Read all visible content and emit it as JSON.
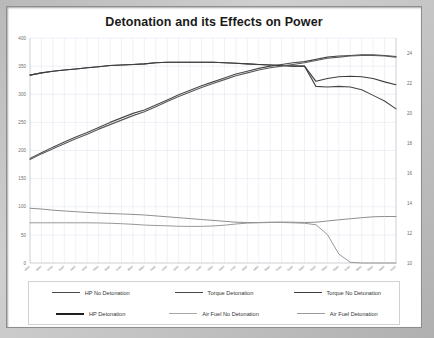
{
  "chart_data": {
    "type": "line",
    "title": "Detonation and its Effects on Power",
    "xlabel": "",
    "ylabel": "",
    "grid": true,
    "legend_position": "bottom",
    "x": [
      2900,
      3000,
      3100,
      3200,
      3300,
      3400,
      3500,
      3600,
      3700,
      3800,
      3900,
      4000,
      4100,
      4200,
      4300,
      4400,
      4500,
      4600,
      4700,
      4800,
      4900,
      5000,
      5100,
      5200,
      5300,
      5400,
      5500,
      5600,
      5700,
      5800,
      5900,
      6000,
      6100
    ],
    "xtick_labels": [
      "2900",
      "3000",
      "3100",
      "3200",
      "3300",
      "3400",
      "3500",
      "3600",
      "3700",
      "3800",
      "3900",
      "4000",
      "4100",
      "4200",
      "4300",
      "4400",
      "4500",
      "4600",
      "4700",
      "4800",
      "4900",
      "5000",
      "5100",
      "5200",
      "5300",
      "5400",
      "5500",
      "5600",
      "5700",
      "5800",
      "5900",
      "6000",
      "6100"
    ],
    "y_left": {
      "label": "",
      "min": 0,
      "max": 400,
      "ticks": [
        0,
        50,
        100,
        150,
        200,
        250,
        300,
        350,
        400
      ]
    },
    "y_right": {
      "label": "",
      "min": 10,
      "max": 25,
      "ticks": [
        10,
        12,
        14,
        16,
        18,
        20,
        22,
        24
      ]
    },
    "series": [
      {
        "name": "HP No Detonation",
        "axis": "left",
        "color": "#4a4a4a",
        "width": 1.1,
        "values": [
          186,
          196,
          206,
          215,
          224,
          232,
          241,
          250,
          258,
          266,
          272,
          281,
          290,
          299,
          307,
          315,
          322,
          329,
          336,
          341,
          346,
          350,
          353,
          356,
          358,
          362,
          366,
          368,
          369,
          370,
          370,
          369,
          367
        ]
      },
      {
        "name": "Torque Detonation",
        "axis": "left",
        "color": "#474747",
        "width": 1.1,
        "values": [
          334,
          338,
          341,
          343,
          345,
          347,
          349,
          351,
          352,
          353,
          354,
          356,
          357,
          357,
          357,
          357,
          357,
          356,
          355,
          354,
          353,
          352,
          351,
          350,
          350,
          314,
          313,
          314,
          313,
          308,
          298,
          288,
          274
        ]
      },
      {
        "name": "Torque No Detonation",
        "axis": "left",
        "color": "#3d3d3d",
        "width": 1.1,
        "values": [
          334,
          338,
          341,
          343,
          345,
          347,
          349,
          351,
          352,
          353,
          354,
          356,
          357,
          357,
          357,
          357,
          357,
          356,
          355,
          354,
          353,
          352,
          351,
          350,
          350,
          323,
          328,
          331,
          332,
          331,
          328,
          322,
          317
        ]
      },
      {
        "name": "HP Detonation",
        "axis": "left",
        "color": "#5a5a5a",
        "width": 1.1,
        "values": [
          184,
          194,
          203,
          212,
          221,
          229,
          238,
          246,
          254,
          262,
          269,
          278,
          287,
          296,
          304,
          312,
          319,
          326,
          333,
          338,
          343,
          347,
          350,
          353,
          356,
          360,
          364,
          366,
          368,
          369,
          369,
          368,
          366
        ]
      },
      {
        "name": "Air Fuel No Detonation",
        "axis": "right",
        "color": "#8f8f8f",
        "width": 1.0,
        "values": [
          13.65,
          13.6,
          13.52,
          13.47,
          13.42,
          13.37,
          13.33,
          13.3,
          13.27,
          13.24,
          13.2,
          13.14,
          13.08,
          13.02,
          12.96,
          12.9,
          12.84,
          12.78,
          12.72,
          12.7,
          12.7,
          12.72,
          12.73,
          12.72,
          12.7,
          12.72,
          12.8,
          12.88,
          12.95,
          13.02,
          13.08,
          13.1,
          13.1
        ]
      },
      {
        "name": "Air Fuel Detonation",
        "axis": "right",
        "color": "#989898",
        "width": 1.0,
        "values": [
          12.68,
          12.68,
          12.68,
          12.68,
          12.68,
          12.68,
          12.67,
          12.65,
          12.62,
          12.58,
          12.53,
          12.5,
          12.48,
          12.45,
          12.44,
          12.44,
          12.47,
          12.52,
          12.6,
          12.66,
          12.68,
          12.7,
          12.7,
          12.68,
          12.65,
          12.55,
          11.9,
          10.6,
          10.05,
          10.0,
          10.0,
          10.0,
          10.0
        ]
      }
    ],
    "annotations": []
  },
  "legend": {
    "rows": [
      [
        {
          "label": "HP No Detonation",
          "color": "#4a4a4a",
          "width": "1.8px"
        },
        {
          "label": "Torque Detonation",
          "color": "#474747",
          "width": "1.8px"
        },
        {
          "label": "Torque No Detonation",
          "color": "#3d3d3d",
          "width": "1.8px"
        }
      ],
      [
        {
          "label": "HP Detonation",
          "color": "#1f1f1f",
          "width": "2.2px"
        },
        {
          "label": "Air Fuel No Detonation",
          "color": "#a8a8a8",
          "width": "1.2px"
        },
        {
          "label": "Air Fuel Detonation",
          "color": "#9a9a9a",
          "width": "1.2px"
        }
      ]
    ]
  }
}
